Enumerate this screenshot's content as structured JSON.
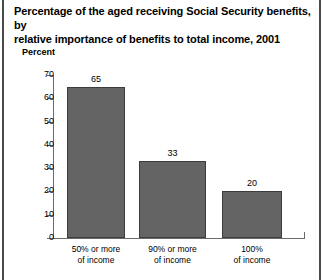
{
  "figure": {
    "title_line1": "Percentage of the aged receiving Social Security benefits, by",
    "title_line2": "relative importance of benefits to total income, 2001"
  },
  "chart_data": {
    "type": "bar",
    "title": "Percentage of the aged receiving Social Security benefits, by relative importance of benefits to total income, 2001",
    "xlabel": "",
    "ylabel": "Percent",
    "ylim": [
      0,
      70
    ],
    "yticks": [
      0,
      10,
      20,
      30,
      40,
      50,
      60,
      70
    ],
    "ytick_labels": [
      "0",
      "10",
      "20",
      "30",
      "40",
      "50",
      "60",
      "70"
    ],
    "grid": false,
    "legend": false,
    "bar_color": "#646464",
    "categories": [
      "50% or more of income",
      "90% or more of income",
      "100% of income"
    ],
    "category_lines": [
      [
        "50% or more",
        "of income"
      ],
      [
        "90% or more",
        "of income"
      ],
      [
        "100%",
        "of income"
      ]
    ],
    "values": [
      65,
      33,
      20
    ],
    "value_labels": [
      "65",
      "33",
      "20"
    ]
  }
}
